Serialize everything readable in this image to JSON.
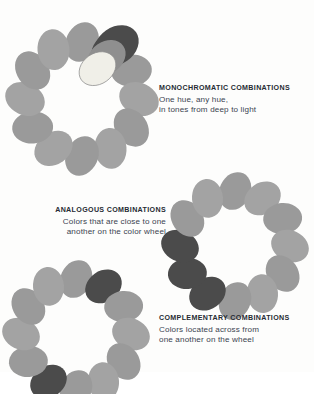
{
  "page": {
    "background_color": "#fdfdfc"
  },
  "palette": {
    "base_gray": "#9a9a9a",
    "base_gray_light": "#a3a3a3",
    "dark_swatch": "#4b4b4b",
    "mid_swatch": "#8f8f8f",
    "light_swatch": "#f0efe8",
    "light_swatch_stroke": "#8d8d8d",
    "text_color": "#3b4350",
    "title_color": "#262b33"
  },
  "sections": [
    {
      "id": "monochromatic",
      "wheel_name": "monochromatic-color-wheel",
      "caption": {
        "title": "MONOCHROMATIC COMBINATIONS",
        "lines": [
          "One hue, any hue,",
          "in tones from deep to light"
        ]
      },
      "swatch_count": 12,
      "highlight_description": "one hue shown stacked in deep, mid and light tones",
      "highlight_indices": [
        1
      ],
      "stack_tones": [
        "#4b4b4b",
        "#8f8f8f",
        "#f0efe8"
      ]
    },
    {
      "id": "analogous",
      "wheel_name": "analogous-color-wheel",
      "caption": {
        "title": "ANALOGOUS COMBINATIONS",
        "lines": [
          "Colors that are close to one",
          "another on the color wheel"
        ]
      },
      "swatch_count": 12,
      "highlight_description": "three adjacent hues darkened on the left of the wheel",
      "highlight_indices": [
        7,
        8,
        9
      ]
    },
    {
      "id": "complementary",
      "wheel_name": "complementary-color-wheel",
      "caption": {
        "title": "COMPLEMENTARY COMBINATIONS",
        "lines": [
          "Colors located across from",
          "one another on the wheel"
        ]
      },
      "swatch_count": 12,
      "highlight_description": "two hues darkened directly opposite each other",
      "highlight_indices": [
        1,
        7
      ]
    }
  ],
  "chart_data": {
    "type": "scatter",
    "xlabel": "",
    "ylabel": "",
    "series": [
      {
        "name": "monochromatic",
        "categories": [
          "1",
          "2",
          "3",
          "4",
          "5",
          "6",
          "7",
          "8",
          "9",
          "10",
          "11",
          "12"
        ],
        "values": [
          0,
          1,
          0,
          0,
          0,
          0,
          0,
          0,
          0,
          0,
          0,
          0
        ],
        "note": "position 2 carries a stack of three tones: deep, mid, light"
      },
      {
        "name": "analogous",
        "categories": [
          "1",
          "2",
          "3",
          "4",
          "5",
          "6",
          "7",
          "8",
          "9",
          "10",
          "11",
          "12"
        ],
        "values": [
          0,
          0,
          0,
          0,
          0,
          0,
          0,
          1,
          1,
          1,
          0,
          0
        ]
      },
      {
        "name": "complementary",
        "categories": [
          "1",
          "2",
          "3",
          "4",
          "5",
          "6",
          "7",
          "8",
          "9",
          "10",
          "11",
          "12"
        ],
        "values": [
          0,
          1,
          0,
          0,
          0,
          0,
          0,
          1,
          0,
          0,
          0,
          0
        ]
      }
    ],
    "legend": [
      "0 = base gray swatch",
      "1 = darkened highlight swatch"
    ]
  }
}
